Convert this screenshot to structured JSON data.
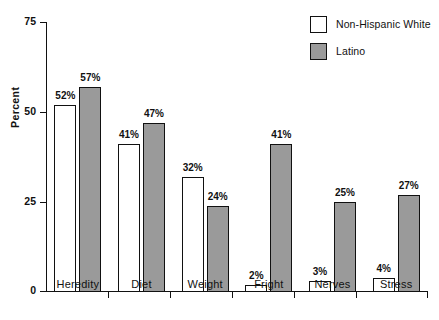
{
  "chart_data": {
    "type": "bar",
    "title": "",
    "xlabel": "",
    "ylabel": "Percent",
    "ylim": [
      0,
      75
    ],
    "yticks": [
      0,
      25,
      50,
      75
    ],
    "grid": false,
    "legend_position": "top-right",
    "categories": [
      "Heredity",
      "Diet",
      "Weight",
      "Fright",
      "Nerves",
      "Stress"
    ],
    "series": [
      {
        "name": "Non-Hispanic White",
        "color": "#ffffff",
        "values": [
          52,
          41,
          32,
          2,
          3,
          4
        ],
        "labels": [
          "52%",
          "41%",
          "32%",
          "2%",
          "3%",
          "4%"
        ]
      },
      {
        "name": "Latino",
        "color": "#9a9a9a",
        "values": [
          57,
          47,
          24,
          41,
          25,
          27
        ],
        "labels": [
          "57%",
          "47%",
          "24%",
          "41%",
          "25%",
          "27%"
        ]
      }
    ]
  },
  "legend": {
    "items": [
      {
        "label": "Non-Hispanic White",
        "swatch": "white"
      },
      {
        "label": "Latino",
        "swatch": "gray"
      }
    ]
  },
  "axes": {
    "y_title": "Percent",
    "y_tick_labels": [
      "75",
      "50",
      "25",
      "0"
    ],
    "x_tick_labels": [
      "Heredity",
      "Diet",
      "Weight",
      "Fright",
      "Nerves",
      "Stress"
    ]
  }
}
